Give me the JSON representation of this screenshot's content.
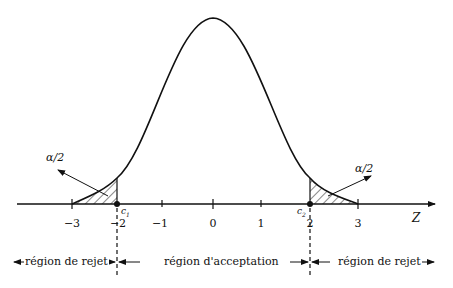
{
  "diagram": {
    "type": "normal-distribution-rejection-regions",
    "axis_label": "Z",
    "ticks": [
      "−3",
      "−2",
      "−1",
      "0",
      "1",
      "2",
      "3"
    ],
    "critical_values": {
      "left": "c",
      "left_sub": "1",
      "right": "c",
      "right_sub": "2"
    },
    "tail_labels": {
      "left": "α/2",
      "right": "α/2"
    },
    "regions": {
      "left": "région de rejet",
      "middle": "région d'acceptation",
      "right": "région de rejet"
    },
    "colors": {
      "stroke": "#111111",
      "background": "#ffffff"
    }
  }
}
